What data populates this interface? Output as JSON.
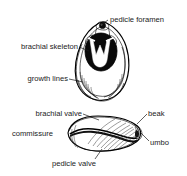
{
  "figure": {
    "background_color": "#ffffff",
    "ink_color": "#1a1a1a",
    "views": [
      {
        "id": "dorsal-view",
        "name": "dorsal view of brachiopod shell with brachial skeleton",
        "position": "upper"
      },
      {
        "id": "lateral-view",
        "name": "lateral view of articulated brachiopod valves",
        "position": "lower"
      }
    ],
    "labels": [
      {
        "id": "pedicle-foramen",
        "text": "pedicle foramen",
        "view": "dorsal-view",
        "side": "right",
        "text_x": 110,
        "text_y": 22,
        "leader": "M108,20 L101,25"
      },
      {
        "id": "brachial-skeleton",
        "text": "brachial skeleton",
        "view": "dorsal-view",
        "side": "left",
        "text_x": 14,
        "text_y": 49,
        "leader": "M79,47 L88,51"
      },
      {
        "id": "growth-lines",
        "text": "growth lines",
        "view": "dorsal-view",
        "side": "left",
        "text_x": 24,
        "text_y": 81,
        "leader": "M69,79 L82,82"
      },
      {
        "id": "brachial-valve",
        "text": "brachial valve",
        "view": "lateral-view",
        "side": "left",
        "text_x": 29,
        "text_y": 116,
        "leader": "M83,114 L98,119"
      },
      {
        "id": "beak",
        "text": "beak",
        "view": "lateral-view",
        "side": "right",
        "text_x": 148,
        "text_y": 116,
        "leader": "M147,115 L137,124"
      },
      {
        "id": "commissure",
        "text": "commissure",
        "view": "lateral-view",
        "side": "left",
        "text_x": 12,
        "text_y": 136,
        "leader": ""
      },
      {
        "id": "umbo",
        "text": "umbo",
        "view": "lateral-view",
        "side": "right",
        "text_x": 150,
        "text_y": 145,
        "leader": "M149,141 L140,131"
      },
      {
        "id": "pedicle-valve",
        "text": "pedicle valve",
        "view": "lateral-view",
        "side": "bottom",
        "text_x": 52,
        "text_y": 164,
        "leader": "M95,160 L101,148"
      }
    ]
  }
}
